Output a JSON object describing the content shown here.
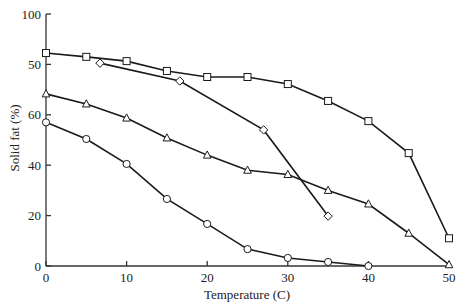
{
  "chart_data": {
    "type": "line",
    "title": "",
    "xlabel": "Temperature (C)",
    "ylabel": "Solid fat (%)",
    "xlim": [
      0,
      50
    ],
    "ylim": [
      0,
      100
    ],
    "x_ticks": [
      0,
      10,
      20,
      30,
      40,
      50
    ],
    "x_tick_labels": [
      "0",
      "10",
      "20",
      "30",
      "40",
      "50"
    ],
    "y_ticks": [
      0,
      20,
      40,
      60,
      80,
      100
    ],
    "y_tick_labels": [
      "0",
      "20",
      "40",
      "60",
      "50",
      "100"
    ],
    "grid": false,
    "legend": null,
    "series": [
      {
        "name": "Series A (squares)",
        "marker": "square",
        "x": [
          0,
          5,
          10,
          15,
          20,
          25,
          30,
          35,
          40,
          45,
          50
        ],
        "values": [
          84.5,
          83,
          81.3,
          77.4,
          75,
          75,
          72.2,
          65.5,
          57.5,
          44.8,
          11
        ]
      },
      {
        "name": "Series B (diamonds)",
        "marker": "diamond",
        "x": [
          6.7,
          16.6,
          27,
          35
        ],
        "values": [
          80.5,
          73.4,
          54,
          19.8
        ]
      },
      {
        "name": "Series C (triangles)",
        "marker": "triangle",
        "x": [
          0,
          5,
          10,
          15,
          20,
          25,
          30,
          35,
          40,
          45,
          50
        ],
        "values": [
          68.3,
          64.3,
          58.7,
          50.8,
          44,
          38,
          36.3,
          30,
          24.6,
          13,
          0.5
        ]
      },
      {
        "name": "Series D (circles)",
        "marker": "circle",
        "x": [
          0,
          5,
          10,
          15,
          20,
          25,
          30,
          35,
          40
        ],
        "values": [
          57,
          50.4,
          40.5,
          26.6,
          16.7,
          6.7,
          3.2,
          1.6,
          0
        ]
      }
    ]
  }
}
